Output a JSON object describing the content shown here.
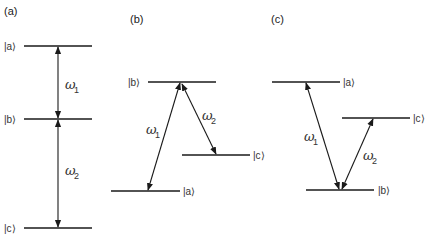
{
  "panels": [
    {
      "id": "a",
      "label": "(a)",
      "type": "cascade",
      "levels": [
        {
          "name": "|a⟩",
          "position": "top"
        },
        {
          "name": "|b⟩",
          "position": "middle"
        },
        {
          "name": "|c⟩",
          "position": "bottom"
        }
      ],
      "transitions": [
        {
          "symbol": "ω",
          "sub": "1",
          "from": "|a⟩",
          "to": "|b⟩",
          "arrow": "double-headed"
        },
        {
          "symbol": "ω",
          "sub": "2",
          "from": "|b⟩",
          "to": "|c⟩",
          "arrow": "double-headed"
        }
      ]
    },
    {
      "id": "b",
      "label": "(b)",
      "type": "lambda",
      "levels": [
        {
          "name": "|b⟩",
          "position": "top"
        },
        {
          "name": "|c⟩",
          "position": "middle"
        },
        {
          "name": "|a⟩",
          "position": "bottom"
        }
      ],
      "transitions": [
        {
          "symbol": "ω",
          "sub": "1",
          "from": "|b⟩",
          "to": "|a⟩",
          "arrow": "double-headed"
        },
        {
          "symbol": "ω",
          "sub": "2",
          "from": "|b⟩",
          "to": "|c⟩",
          "arrow": "double-headed"
        }
      ]
    },
    {
      "id": "c",
      "label": "(c)",
      "type": "vee",
      "levels": [
        {
          "name": "|a⟩",
          "position": "top"
        },
        {
          "name": "|c⟩",
          "position": "middle"
        },
        {
          "name": "|b⟩",
          "position": "bottom"
        }
      ],
      "transitions": [
        {
          "symbol": "ω",
          "sub": "1",
          "from": "|b⟩",
          "to": "|a⟩",
          "arrow": "double-headed"
        },
        {
          "symbol": "ω",
          "sub": "2",
          "from": "|b⟩",
          "to": "|c⟩",
          "arrow": "double-headed"
        }
      ]
    }
  ],
  "colors": {
    "ink": "#1a1a1a",
    "text": "#333333",
    "background": "#ffffff"
  }
}
